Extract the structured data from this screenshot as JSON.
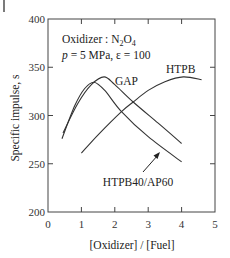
{
  "chart_data": {
    "type": "line",
    "title": "",
    "xlabel": "[Oxidizer] / [Fuel]",
    "ylabel": "Specific impulse, s",
    "xlim": [
      0,
      5
    ],
    "ylim": [
      200,
      400
    ],
    "xticks": [
      0,
      1,
      2,
      3,
      4,
      5
    ],
    "yticks": [
      200,
      250,
      300,
      350,
      400
    ],
    "grid": false,
    "legend": "none (inline labels)",
    "annotations": [
      "Oxidizer : N2O4",
      "p = 5 MPa,  ε = 100"
    ],
    "series": [
      {
        "name": "HTPB40/AP60",
        "x": [
          0.42,
          0.8,
          1.1,
          1.38,
          1.7,
          2.2,
          3.0,
          4.0
        ],
        "y": [
          276,
          310,
          328,
          334.5,
          326,
          304,
          278,
          252
        ]
      },
      {
        "name": "GAP",
        "x": [
          0.45,
          0.9,
          1.3,
          1.68,
          2.0,
          2.55,
          3.3,
          4.0
        ],
        "y": [
          282,
          313,
          332,
          340,
          332,
          314,
          292,
          271
        ]
      },
      {
        "name": "HTPB",
        "x": [
          1.0,
          1.5,
          2.2,
          2.55,
          3.0,
          3.5,
          4.05,
          4.6
        ],
        "y": [
          261,
          280,
          304,
          314,
          326,
          335,
          340,
          337
        ]
      }
    ]
  },
  "labels": {
    "xlabel": "[Oxidizer] / [Fuel]",
    "ylabel": "Specific impulse, s",
    "oxidizer_prefix": "Oxidizer : N",
    "oxidizer_sub1": "2",
    "oxidizer_mid": "O",
    "oxidizer_sub2": "4",
    "cond_p": "p",
    "cond_rest": " = 5 MPa,  ε = 100",
    "series_gap": "GAP",
    "series_htpb": "HTPB",
    "series_htpb_ap": "HTPB40/AP60"
  },
  "axis": {
    "y_ticks": [
      "400",
      "350",
      "300",
      "250",
      "200"
    ],
    "x_ticks": [
      "0",
      "1",
      "2",
      "3",
      "4",
      "5"
    ]
  }
}
